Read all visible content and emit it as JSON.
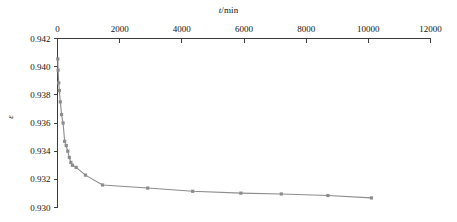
{
  "chart_data": {
    "type": "line",
    "title": "",
    "xlabel": "t/min",
    "xlabel_symbol": "t",
    "xlabel_unit": "/min",
    "ylabel": "ε",
    "xlim": [
      0,
      12000
    ],
    "ylim": [
      0.93,
      0.942
    ],
    "grid": false,
    "legend": "none",
    "x_axis_position": "top",
    "y_axis_position": "left",
    "xticks": [
      0,
      2000,
      4000,
      6000,
      8000,
      10000,
      12000
    ],
    "xtick_labels": [
      "0",
      "2000",
      "4000",
      "6000",
      "8000",
      "10000",
      "12000"
    ],
    "yticks": [
      0.93,
      0.932,
      0.934,
      0.936,
      0.938,
      0.94,
      0.942
    ],
    "ytick_labels": [
      "0.930",
      "0.932",
      "0.934",
      "0.936",
      "0.938",
      "0.940",
      "0.942"
    ],
    "series": [
      {
        "name": "void-ratio-vs-time",
        "color": "#8c8c8c",
        "marker": "square",
        "x": [
          10,
          20,
          40,
          60,
          90,
          130,
          180,
          230,
          280,
          330,
          380,
          430,
          480,
          600,
          900,
          1450,
          2900,
          4350,
          5900,
          7200,
          8700,
          10100
        ],
        "y": [
          0.94055,
          0.93975,
          0.93885,
          0.9383,
          0.9375,
          0.9366,
          0.936,
          0.9347,
          0.9344,
          0.934,
          0.93355,
          0.9332,
          0.933,
          0.93285,
          0.9323,
          0.9316,
          0.93138,
          0.93115,
          0.93102,
          0.93096,
          0.93085,
          0.93068
        ]
      }
    ]
  },
  "figure": {
    "background_color": "#ffffff",
    "axis_color": "#3b3b3b",
    "series_color": "#8c8c8c"
  }
}
